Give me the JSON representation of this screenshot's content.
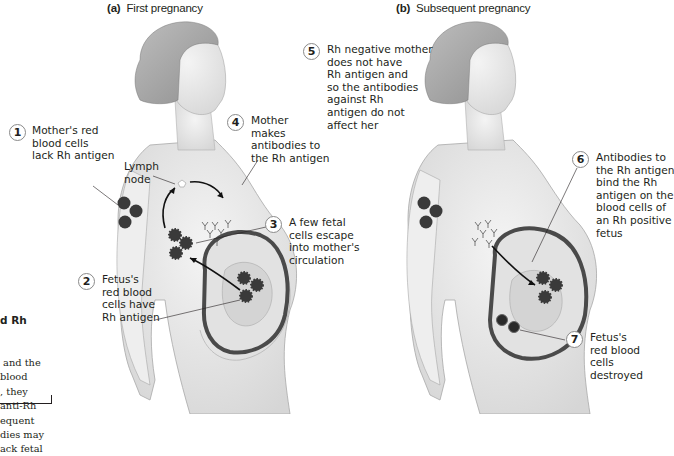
{
  "panels": [
    {
      "id": "a",
      "letter": "(a)",
      "title": "First pregnancy",
      "callouts": [
        {
          "number": "1",
          "text": "Mother's red\nblood cells\nlack Rh antigen"
        },
        {
          "number": "2",
          "text": "Fetus's\nred blood\ncells have\nRh antigen"
        },
        {
          "number": "3",
          "text": "A few fetal\ncells escape\ninto mother's\ncirculation"
        },
        {
          "number": "4",
          "text": "Mother\nmakes\nantibodies to\nthe Rh antigen"
        }
      ],
      "annotations": [
        {
          "text": "Lymph\nnode"
        }
      ]
    },
    {
      "id": "b",
      "letter": "(b)",
      "title": "Subsequent pregnancy",
      "callouts": [
        {
          "number": "5",
          "text": "Rh negative mother\ndoes not have\nRh antigen and\nso the antibodies\nagainst Rh\nantigen do not\naffect her"
        },
        {
          "number": "6",
          "text": "Antibodies to\nthe Rh antigen\nbind the Rh\nantigen on the\nblood cells of\nan Rh positive\nfetus"
        },
        {
          "number": "7",
          "text": "Fetus's\nred blood\ncells\ndestroyed"
        }
      ]
    }
  ],
  "sidebar": {
    "heading": "d Rh",
    "text": " and the\nblood\n, they\nanti-Rh\nequent\ndies may\nack fetal"
  },
  "colors": {
    "text": "#231f20",
    "skin": "#e9e9e9",
    "outline": "#8c8c8c",
    "uterus": "#4a4a4a",
    "cells": "#3a3a3a"
  }
}
